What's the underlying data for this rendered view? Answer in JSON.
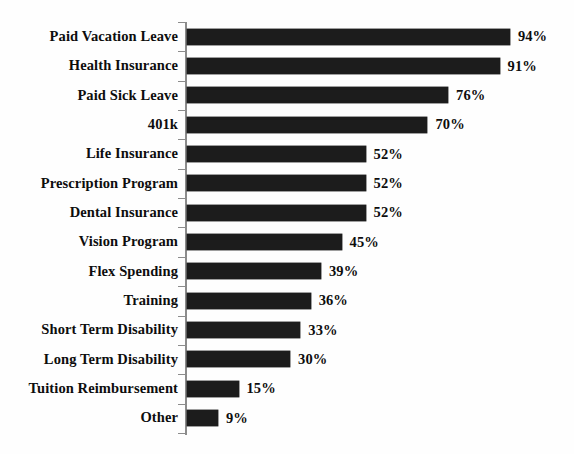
{
  "chart_data": {
    "type": "bar",
    "orientation": "horizontal",
    "title": "",
    "subtitle": "",
    "xlabel": "",
    "ylabel": "",
    "xlim": [
      0,
      100
    ],
    "grid": false,
    "legend": false,
    "value_suffix": "%",
    "bar_color": "#1c1c1c",
    "axis_color": "#8c8c8c",
    "background_color": "#fefefe",
    "categories": [
      "Paid Vacation Leave",
      "Health Insurance",
      "Paid Sick Leave",
      "401k",
      "Life Insurance",
      "Prescription Program",
      "Dental Insurance",
      "Vision Program",
      "Flex Spending",
      "Training",
      "Short Term Disability",
      "Long Term Disability",
      "Tuition Reimbursement",
      "Other"
    ],
    "values": [
      94,
      91,
      76,
      70,
      52,
      52,
      52,
      45,
      39,
      36,
      33,
      30,
      15,
      9
    ],
    "data_labels": [
      "94%",
      "91%",
      "76%",
      "70%",
      "52%",
      "52%",
      "52%",
      "45%",
      "39%",
      "36%",
      "33%",
      "30%",
      "15%",
      "9%"
    ]
  }
}
